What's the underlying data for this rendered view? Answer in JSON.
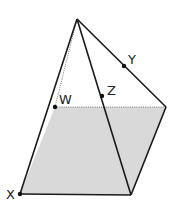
{
  "diagram": {
    "type": "pyramid",
    "colors": {
      "base_fill": "#d9d9d9",
      "edge": "#1a1a1a",
      "hidden_edge": "#555555",
      "background": "#ffffff"
    },
    "vertices": {
      "apex": {
        "x": 77,
        "y": 19
      },
      "X": {
        "x": 20,
        "y": 194
      },
      "back_left": {
        "x": 55,
        "y": 107
      },
      "back_right": {
        "x": 166,
        "y": 107
      },
      "front_right": {
        "x": 131,
        "y": 195
      }
    },
    "points": [
      {
        "name": "W",
        "label": "W",
        "x": 55,
        "y": 107
      },
      {
        "name": "Z",
        "label": "Z",
        "x": 102,
        "y": 96
      },
      {
        "name": "Y",
        "label": "Y",
        "x": 124,
        "y": 66
      },
      {
        "name": "X",
        "label": "X",
        "x": 20,
        "y": 194
      }
    ],
    "labels": {
      "X": "X",
      "W": "W",
      "Z": "Z",
      "Y": "Y"
    }
  }
}
